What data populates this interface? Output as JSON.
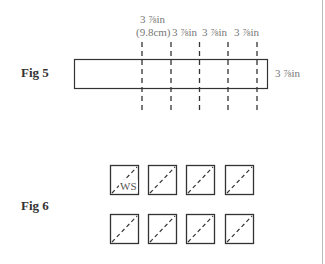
{
  "fig5": {
    "label": "Fig 5",
    "top_labels": [
      {
        "line1": "3 ⅞in",
        "line2": "(9.8cm)"
      },
      {
        "line1": "3 ⅞in"
      },
      {
        "line1": "3 ⅞in"
      },
      {
        "line1": "3 ⅞in"
      }
    ],
    "side_label": "3 ⅞in",
    "cut_line_count": 5
  },
  "fig6": {
    "label": "Fig 6",
    "grid": {
      "rows": 2,
      "cols": 4
    },
    "square_annotation": "WS",
    "diagonal": "dashed, bottom-left to top-right"
  },
  "colors": {
    "line": "#333333",
    "label": "#777777"
  }
}
